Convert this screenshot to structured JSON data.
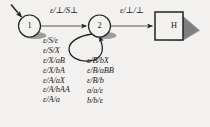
{
  "diagram": {
    "type": "pushdown-automaton-state-diagram",
    "background_color": "#f2f1ef",
    "ink_color": "#232323",
    "shadow_color": "#8d8d8d",
    "states": [
      {
        "id": "1",
        "label": "1",
        "shape": "circle",
        "cx": 29.5,
        "cy": 26,
        "r": 11
      },
      {
        "id": "2",
        "label": "2",
        "shape": "circle",
        "cx": 99.5,
        "cy": 26,
        "r": 11
      },
      {
        "id": "H",
        "label": "H",
        "shape": "square",
        "x": 155,
        "y": 12,
        "size": 28
      }
    ],
    "start_arrow": {
      "from_x": 11,
      "from_y": 4,
      "to_x": 23,
      "to_y": 18
    },
    "transitions": [
      {
        "from": "1",
        "to": "2",
        "label": "ε/⊥/S⊥"
      },
      {
        "from": "2",
        "to": "H",
        "label": "ε/⊥/⊥"
      }
    ],
    "self_loop": {
      "state": "2",
      "label_columns": [
        {
          "name": "left",
          "labels": [
            "ε/S/ε",
            "ε/S/X",
            "ε/X/aB",
            "ε/X/bA",
            "ε/A/aX",
            "ε/A/bAA",
            "ε/A/a"
          ]
        },
        {
          "name": "right",
          "labels": [
            "ε/B/bX",
            "ε/B/aBB",
            "ε/B/b",
            "a/a/ε",
            "b/b/ε"
          ]
        }
      ]
    }
  }
}
